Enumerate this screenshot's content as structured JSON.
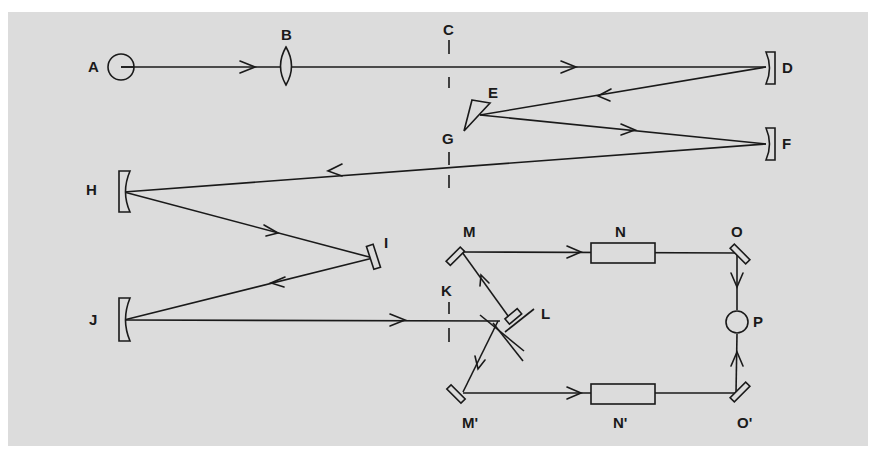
{
  "diagram": {
    "type": "optical-setup-schematic",
    "background_color": "#dcdcdc",
    "line_color": "#1a1a1a",
    "labels": {
      "A": "A",
      "B": "B",
      "C": "C",
      "D": "D",
      "E": "E",
      "F": "F",
      "G": "G",
      "H": "H",
      "I": "I",
      "J": "J",
      "K": "K",
      "L": "L",
      "M": "M",
      "N": "N",
      "O": "O",
      "P": "P",
      "M_prime": "M'",
      "N_prime": "N'",
      "O_prime": "O'"
    },
    "components": [
      {
        "id": "A",
        "shape": "circle",
        "role": "source"
      },
      {
        "id": "B",
        "shape": "lens"
      },
      {
        "id": "C",
        "shape": "slit"
      },
      {
        "id": "D",
        "shape": "concave-mirror"
      },
      {
        "id": "E",
        "shape": "prism"
      },
      {
        "id": "F",
        "shape": "concave-mirror"
      },
      {
        "id": "G",
        "shape": "slit"
      },
      {
        "id": "H",
        "shape": "concave-mirror"
      },
      {
        "id": "I",
        "shape": "plane-mirror"
      },
      {
        "id": "J",
        "shape": "concave-mirror"
      },
      {
        "id": "K",
        "shape": "slit"
      },
      {
        "id": "L",
        "shape": "beam-splitter"
      },
      {
        "id": "M",
        "shape": "plane-mirror"
      },
      {
        "id": "N",
        "shape": "rectangle-cell"
      },
      {
        "id": "O",
        "shape": "plane-mirror"
      },
      {
        "id": "P",
        "shape": "circle",
        "role": "detector"
      },
      {
        "id": "M'",
        "shape": "plane-mirror"
      },
      {
        "id": "N'",
        "shape": "rectangle-cell"
      },
      {
        "id": "O'",
        "shape": "plane-mirror"
      }
    ],
    "beam_path": [
      "A",
      "B",
      "C",
      "D",
      "E",
      "F",
      "G",
      "H",
      "I",
      "J",
      "K",
      "L",
      "M",
      "N",
      "O",
      "P",
      "M'",
      "N'",
      "O'",
      "P"
    ]
  }
}
